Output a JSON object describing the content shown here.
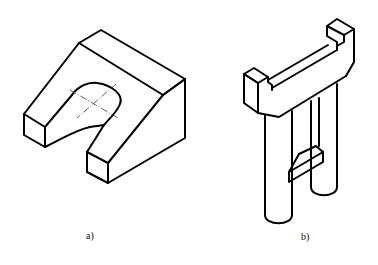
{
  "figures": [
    {
      "id": "a",
      "label": "a)",
      "description": "Isometric view of a block with a U-shaped slot and sloped faces, slot center marked with dash-dot centerlines"
    },
    {
      "id": "b",
      "label": "b)",
      "description": "Isometric view of a frame with a top beam with raised end blocks, two cylindrical legs and a connecting rung"
    }
  ],
  "colors": {
    "stroke": "#000000",
    "background": "#ffffff",
    "centerline": "#333333"
  }
}
